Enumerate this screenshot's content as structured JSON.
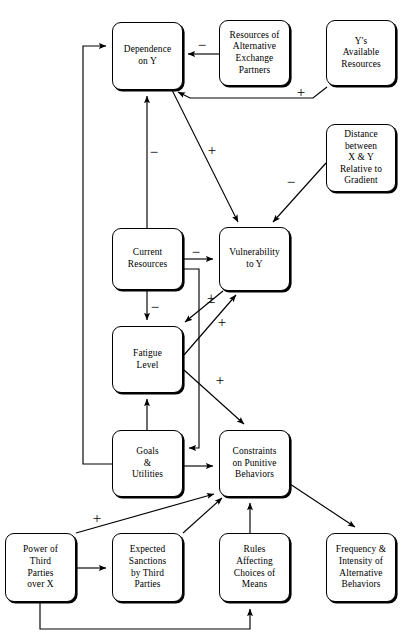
{
  "diagram": {
    "type": "causal-loop-diagram",
    "width": 416,
    "height": 643,
    "background_color": "#ffffff",
    "line_color": "#000000",
    "nodes": [
      {
        "id": "dependence_on_y",
        "label": "Dependence\non Y",
        "x": 112,
        "y": 22,
        "w": 71,
        "h": 68
      },
      {
        "id": "resources_alt_partners",
        "label": "Resources of\nAlternative\nExchange\nPartners",
        "x": 219,
        "y": 20,
        "w": 71,
        "h": 66
      },
      {
        "id": "ys_available_resources",
        "label": "Y's\nAvailable\nResources",
        "x": 326,
        "y": 20,
        "w": 70,
        "h": 66
      },
      {
        "id": "distance_x_y",
        "label": "Distance\nbetween\nX & Y\nRelative to\nGradient",
        "x": 326,
        "y": 124,
        "w": 70,
        "h": 68
      },
      {
        "id": "current_resources",
        "label": "Current\nResources",
        "x": 112,
        "y": 228,
        "w": 71,
        "h": 62
      },
      {
        "id": "vulnerability_to_y",
        "label": "Vulnerability\nto Y",
        "x": 219,
        "y": 227,
        "w": 71,
        "h": 64
      },
      {
        "id": "fatigue_level",
        "label": "Fatigue\nLevel",
        "x": 112,
        "y": 326,
        "w": 71,
        "h": 67
      },
      {
        "id": "goals_utilities",
        "label": "Goals\n&\nUtilities",
        "x": 112,
        "y": 430,
        "w": 71,
        "h": 67
      },
      {
        "id": "constraints_punitive",
        "label": "Constraints\non Punitive\nBehaviors",
        "x": 219,
        "y": 430,
        "w": 71,
        "h": 67
      },
      {
        "id": "power_third_parties",
        "label": "Power of\nThird\nParties\nover X",
        "x": 5,
        "y": 533,
        "w": 71,
        "h": 69
      },
      {
        "id": "expected_sanctions",
        "label": "Expected\nSanctions\nby Third\nParties",
        "x": 112,
        "y": 533,
        "w": 71,
        "h": 69
      },
      {
        "id": "rules_affecting_choices",
        "label": "Rules\nAffecting\nChoices of\nMeans",
        "x": 219,
        "y": 533,
        "w": 71,
        "h": 69
      },
      {
        "id": "frequency_intensity",
        "label": "Frequency &\nIntensity of\nAlternative\nBehaviors",
        "x": 326,
        "y": 533,
        "w": 70,
        "h": 69
      }
    ],
    "edges": [
      {
        "id": "e-altpartners-dependence",
        "from": "resources_alt_partners",
        "to": "dependence_on_y",
        "sign": "−",
        "sign_x": 202,
        "sign_y": 45,
        "points": "219,54 188,54"
      },
      {
        "id": "e-ysresources-dependence",
        "from": "ys_available_resources",
        "to": "dependence_on_y",
        "sign": "+",
        "sign_x": 301,
        "sign_y": 92,
        "points": "327,87 313,98 190,98 178,92"
      },
      {
        "id": "e-currentresources-dependence",
        "from": "current_resources",
        "to": "dependence_on_y",
        "sign": "−",
        "sign_x": 154,
        "sign_y": 152,
        "points": "147,228 147,96"
      },
      {
        "id": "e-goals-dependence",
        "from": "goals_utilities",
        "to": "dependence_on_y",
        "sign": "",
        "sign_x": 0,
        "sign_y": 0,
        "points": "112,464 83,464 83,46 106,46"
      },
      {
        "id": "e-dependence-vulnerability",
        "from": "dependence_on_y",
        "to": "vulnerability_to_y",
        "sign": "+",
        "sign_x": 212,
        "sign_y": 150,
        "points": "172,90 238,222"
      },
      {
        "id": "e-distance-vulnerability",
        "from": "distance_x_y",
        "to": "vulnerability_to_y",
        "sign": "−",
        "sign_x": 291,
        "sign_y": 182,
        "points": "326,163 273,222"
      },
      {
        "id": "e-currentresources-vulnerability",
        "from": "current_resources",
        "to": "vulnerability_to_y",
        "sign": "−",
        "sign_x": 196,
        "sign_y": 252,
        "points": "183,259 213,259"
      },
      {
        "id": "e-currentresources-goals",
        "from": "current_resources",
        "to": "goals_utilities",
        "sign": "",
        "sign_x": 0,
        "sign_y": 0,
        "points": "183,269 199,269 199,448 189,448"
      },
      {
        "id": "e-currentresources-fatigue",
        "from": "current_resources",
        "to": "fatigue_level",
        "sign": "−",
        "sign_x": 155,
        "sign_y": 307,
        "points": "147,290 147,320"
      },
      {
        "id": "e-vulnerability-fatigue",
        "from": "vulnerability_to_y",
        "to": "fatigue_level",
        "sign": "±",
        "sign_x": 211,
        "sign_y": 298,
        "points": "223,291 185,322"
      },
      {
        "id": "e-fatigue-vulnerability",
        "from": "fatigue_level",
        "to": "vulnerability_to_y",
        "sign": "+",
        "sign_x": 222,
        "sign_y": 322,
        "points": "184,355 236,295"
      },
      {
        "id": "e-fatigue-constraints",
        "from": "fatigue_level",
        "to": "constraints_punitive",
        "sign": "+",
        "sign_x": 220,
        "sign_y": 380,
        "points": "184,370 244,424"
      },
      {
        "id": "e-goals-fatigue",
        "from": "goals_utilities",
        "to": "fatigue_level",
        "sign": "",
        "sign_x": 0,
        "sign_y": 0,
        "points": "147,430 147,399"
      },
      {
        "id": "e-goals-constraints",
        "from": "goals_utilities",
        "to": "constraints_punitive",
        "sign": "",
        "sign_x": 0,
        "sign_y": 0,
        "points": "183,466 213,466"
      },
      {
        "id": "e-constraints-frequency",
        "from": "constraints_punitive",
        "to": "frequency_intensity",
        "sign": "",
        "sign_x": 0,
        "sign_y": 0,
        "points": "290,484 355,527"
      },
      {
        "id": "e-power-constraints",
        "from": "power_third_parties",
        "to": "constraints_punitive",
        "sign": "+",
        "sign_x": 97,
        "sign_y": 518,
        "points": "76,533 214,494"
      },
      {
        "id": "e-power-sanctions",
        "from": "power_third_parties",
        "to": "expected_sanctions",
        "sign": "",
        "sign_x": 0,
        "sign_y": 0,
        "points": "76,568 106,568"
      },
      {
        "id": "e-power-rules",
        "from": "power_third_parties",
        "to": "rules_affecting_choices",
        "sign": "",
        "sign_x": 0,
        "sign_y": 0,
        "points": "40,602 40,629 250,629 250,609"
      },
      {
        "id": "e-sanctions-constraints",
        "from": "expected_sanctions",
        "to": "constraints_punitive",
        "sign": "",
        "sign_x": 0,
        "sign_y": 0,
        "points": "183,533 222,498"
      },
      {
        "id": "e-rules-constraints",
        "from": "rules_affecting_choices",
        "to": "constraints_punitive",
        "sign": "",
        "sign_x": 0,
        "sign_y": 0,
        "points": "250,533 250,503"
      }
    ]
  }
}
